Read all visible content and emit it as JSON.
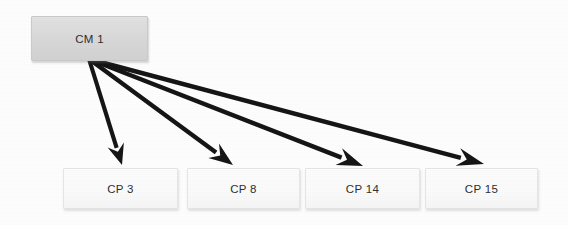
{
  "diagram": {
    "type": "node-link",
    "background_color": "#fefefe",
    "edge_color": "#151515",
    "source_node_fill": "#d8d8d8",
    "target_node_fill": "#fbfbfb",
    "text_color": "#2e2e2e",
    "source_nodes": [
      {
        "id": "cm-1",
        "label": "CM 1",
        "x": 31,
        "y": 16,
        "width": 117,
        "height": 45
      }
    ],
    "target_nodes": [
      {
        "id": "cp-3",
        "label": "CP 3",
        "x": 63,
        "y": 168,
        "width": 115,
        "height": 41
      },
      {
        "id": "cp-8",
        "label": "CP 8",
        "x": 187,
        "y": 168,
        "width": 113,
        "height": 41
      },
      {
        "id": "cp-14",
        "label": "CP 14",
        "x": 305,
        "y": 168,
        "width": 115,
        "height": 41
      },
      {
        "id": "cp-15",
        "label": "CP 15",
        "x": 425,
        "y": 168,
        "width": 113,
        "height": 41
      }
    ],
    "edges": [
      {
        "id": "edge-cm1-cp3",
        "from": "cm-1",
        "to": "cp-3",
        "from_x": 89,
        "from_y": 59,
        "to_x": 122,
        "to_y": 165,
        "stroke_width": 4.2,
        "head_length": 21,
        "head_half_width": 8.5
      },
      {
        "id": "edge-cm1-cp8",
        "from": "cm-1",
        "to": "cp-8",
        "from_x": 89,
        "from_y": 59,
        "to_x": 233,
        "to_y": 165,
        "stroke_width": 4.4,
        "head_length": 24,
        "head_half_width": 9
      },
      {
        "id": "edge-cm1-cp14",
        "from": "cm-1",
        "to": "cp-14",
        "from_x": 89,
        "from_y": 59,
        "to_x": 363,
        "to_y": 166,
        "stroke_width": 4.4,
        "head_length": 26,
        "head_half_width": 9
      },
      {
        "id": "edge-cm1-cp15",
        "from": "cm-1",
        "to": "cp-15",
        "from_x": 89,
        "from_y": 59,
        "to_x": 484,
        "to_y": 164,
        "stroke_width": 4.4,
        "head_length": 27,
        "head_half_width": 9
      }
    ]
  }
}
